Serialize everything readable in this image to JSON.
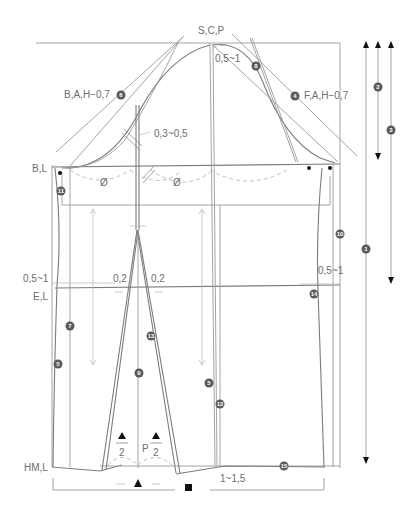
{
  "diagram": {
    "type": "pattern-drafting",
    "labels": {
      "scp": "S,C,P",
      "scp_offset": "0,5~1",
      "bah": "B,A,H−0,7",
      "fah": "F,A,H−0,7",
      "armhole_offset": "0,3~0,5",
      "bust_line": "B,L",
      "waist_offset_left": "0,5~1",
      "waist_offset_right": "0,5~1",
      "elastic_line": "E,L",
      "dart_left": "0,2",
      "dart_right": "0,2",
      "hem_line": "HM,L",
      "hem_offset": "1~1,5",
      "pleat_p": "P",
      "half_left": "2",
      "half_right": "2",
      "phi_left": "Ø",
      "phi_right": "Ø"
    },
    "step_markers": [
      {
        "id": "1",
        "glyph": "1"
      },
      {
        "id": "2",
        "glyph": "2"
      },
      {
        "id": "3",
        "glyph": "3"
      },
      {
        "id": "4",
        "glyph": "4"
      },
      {
        "id": "5a",
        "glyph": "5"
      },
      {
        "id": "5b",
        "glyph": "5"
      },
      {
        "id": "6",
        "glyph": "6"
      },
      {
        "id": "7",
        "glyph": "7"
      },
      {
        "id": "8",
        "glyph": "8"
      },
      {
        "id": "9",
        "glyph": "9"
      },
      {
        "id": "10",
        "glyph": "10"
      },
      {
        "id": "11",
        "glyph": "11"
      },
      {
        "id": "12",
        "glyph": "12"
      },
      {
        "id": "13",
        "glyph": "13"
      },
      {
        "id": "14",
        "glyph": "14"
      },
      {
        "id": "15",
        "glyph": "15"
      }
    ],
    "symbols": {
      "triangle": "▲",
      "square": "■"
    },
    "colors": {
      "line": "#9a9a9a",
      "text": "#6d6d6d",
      "marker_fill": "#5a5a5a",
      "accent": "#111111"
    }
  }
}
